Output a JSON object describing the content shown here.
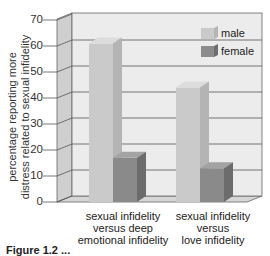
{
  "chart_data": {
    "type": "bar",
    "title": "",
    "xlabel": "",
    "ylabel": "percentage reporting more distress related to sexual infidelity",
    "ylim": [
      0,
      70
    ],
    "yticks": [
      0,
      10,
      20,
      30,
      40,
      50,
      60,
      70
    ],
    "grid": true,
    "style": "3d",
    "legend_position": "upper right",
    "categories": [
      "sexual infidelity versus deep emotional infidelity",
      "sexual infidelity versus love infidelity"
    ],
    "category_lines": [
      [
        "sexual infidelity",
        "versus deep",
        "emotional infidelity"
      ],
      [
        "sexual infidelity",
        "versus",
        "love infidelity"
      ]
    ],
    "series": [
      {
        "name": "male",
        "values": [
          61,
          44
        ],
        "color": "#c9c9c9"
      },
      {
        "name": "female",
        "values": [
          17,
          13
        ],
        "color": "#8a8a8a"
      }
    ]
  },
  "ylabel_lines": [
    "percentage reporting more",
    "distress related to sexual infidelity"
  ],
  "legend": {
    "male": "male",
    "female": "female"
  },
  "ticks": [
    "70",
    "60",
    "50",
    "40",
    "30",
    "20",
    "10",
    "0"
  ],
  "caption_partial": "Figure 1.2 ..."
}
